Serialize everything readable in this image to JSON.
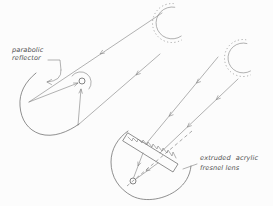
{
  "diagram": {
    "paper_color": "#fcfcfc",
    "ink_color": "#6b6b6b",
    "labels": {
      "reflector": {
        "line1": "parabolic",
        "line2": "reflector"
      },
      "lens": {
        "line1": "extruded acrylic",
        "line2": "fresnel lens"
      }
    }
  }
}
